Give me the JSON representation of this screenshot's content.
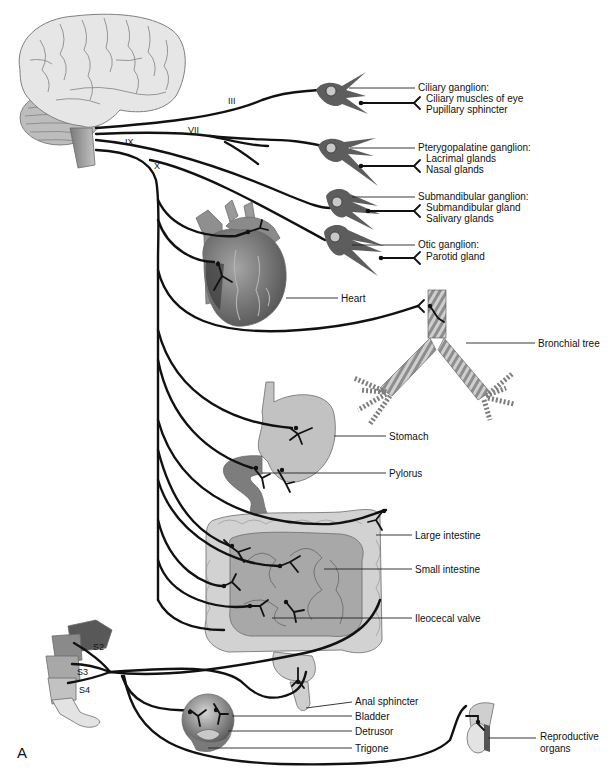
{
  "panel_label": "A",
  "cranial_nerves": [
    {
      "id": "III",
      "label": "III"
    },
    {
      "id": "VII",
      "label": "VII"
    },
    {
      "id": "IX",
      "label": "IX"
    },
    {
      "id": "X",
      "label": "X"
    }
  ],
  "ganglia": [
    {
      "name": "Ciliary ganglion:",
      "targets": [
        "Ciliary muscles of eye",
        "Pupillary sphincter"
      ]
    },
    {
      "name": "Pterygopalatine ganglion:",
      "targets": [
        "Lacrimal glands",
        "Nasal glands"
      ]
    },
    {
      "name": "Submandibular ganglion:",
      "targets": [
        "Submandibular gland",
        "Salivary glands"
      ]
    },
    {
      "name": "Otic ganglion:",
      "targets": [
        "Parotid gland"
      ]
    }
  ],
  "organs": {
    "heart": "Heart",
    "bronchial_tree": "Bronchial tree",
    "stomach": "Stomach",
    "pylorus": "Pylorus",
    "large_intestine": "Large intestine",
    "small_intestine": "Small intestine",
    "ileocecal_valve": "Ileocecal valve",
    "anal_sphincter": "Anal sphincter",
    "bladder": "Bladder",
    "detrusor": "Detrusor",
    "trigone": "Trigone",
    "reproductive_line1": "Reproductive",
    "reproductive_line2": "organs"
  },
  "sacral_nerves": [
    {
      "id": "S2",
      "label": "S2"
    },
    {
      "id": "S3",
      "label": "S3"
    },
    {
      "id": "S4",
      "label": "S4"
    }
  ],
  "colors": {
    "nerve": "#111111",
    "brain": "#e4e4e4",
    "organ_light": "#c9c9c9",
    "organ_mid": "#9a9a9a",
    "organ_dark": "#5e5e5e",
    "background": "#ffffff"
  }
}
